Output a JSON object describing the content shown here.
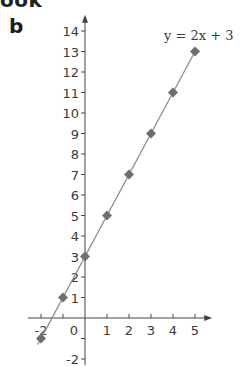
{
  "page": {
    "cropped_heading": "ook",
    "panel_label": "b"
  },
  "chart_data": {
    "type": "line",
    "title": "",
    "equation_label": "y = 2x + 3",
    "xlabel": "",
    "ylabel": "",
    "x": [
      -2,
      -1,
      0,
      1,
      2,
      3,
      4,
      5
    ],
    "series": [
      {
        "name": "y = 2x + 3",
        "values": [
          -1,
          1,
          3,
          5,
          7,
          9,
          11,
          13
        ],
        "marker": "diamond",
        "color": "#7a7a7a"
      }
    ],
    "xlim": [
      -2.5,
      5.6
    ],
    "ylim": [
      -2.3,
      14.7
    ],
    "x_ticks": [
      -2,
      -1,
      0,
      1,
      2,
      3,
      4,
      5
    ],
    "x_tick_labels": [
      "-2",
      "",
      "0",
      "1",
      "2",
      "3",
      "4",
      "5"
    ],
    "y_ticks": [
      -2,
      -1,
      1,
      2,
      3,
      4,
      5,
      6,
      7,
      8,
      9,
      10,
      11,
      12,
      13,
      14
    ],
    "y_tick_labels": [
      "-2",
      "",
      "1",
      "2",
      "3",
      "4",
      "5",
      "6",
      "7",
      "8",
      "9",
      "10",
      "11",
      "12",
      "13",
      "14"
    ],
    "grid": false,
    "legend": "none",
    "colors": {
      "axis": "#444444",
      "line": "#8a8a8a",
      "marker": "#6e6e6e",
      "text": "#3a3a3a"
    }
  }
}
